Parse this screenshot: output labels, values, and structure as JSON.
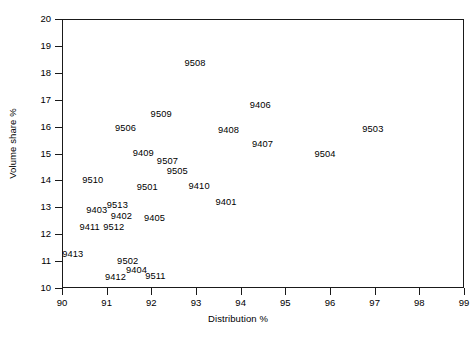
{
  "chart_data": {
    "type": "scatter",
    "title": "",
    "xlabel": "Distribution %",
    "ylabel": "Volume share %",
    "xlim": [
      90,
      99
    ],
    "ylim": [
      10,
      20
    ],
    "xticks": [
      90,
      91,
      92,
      93,
      94,
      95,
      96,
      97,
      98,
      99
    ],
    "yticks": [
      10,
      11,
      12,
      13,
      14,
      15,
      16,
      17,
      18,
      19,
      20
    ],
    "xtick_labels": [
      "90",
      "91",
      "92",
      "93",
      "94",
      "95",
      "96",
      "97",
      "98",
      "99"
    ],
    "ytick_labels": [
      "10",
      "11",
      "12",
      "13",
      "14",
      "15",
      "16",
      "17",
      "18",
      "19",
      "20"
    ],
    "grid": false,
    "legend": "none",
    "marker": "text-label",
    "points": [
      {
        "label": "9508",
        "x": 92.98,
        "y": 18.32
      },
      {
        "label": "9406",
        "x": 94.44,
        "y": 16.77
      },
      {
        "label": "9509",
        "x": 92.22,
        "y": 16.43
      },
      {
        "label": "9506",
        "x": 91.42,
        "y": 15.91
      },
      {
        "label": "9503",
        "x": 96.96,
        "y": 15.87
      },
      {
        "label": "9408",
        "x": 93.73,
        "y": 15.83
      },
      {
        "label": "9407",
        "x": 94.49,
        "y": 15.3
      },
      {
        "label": "9409",
        "x": 91.82,
        "y": 15.0
      },
      {
        "label": "9504",
        "x": 95.89,
        "y": 14.96
      },
      {
        "label": "9507",
        "x": 92.36,
        "y": 14.67
      },
      {
        "label": "9505",
        "x": 92.58,
        "y": 14.3
      },
      {
        "label": "9510",
        "x": 90.69,
        "y": 13.96
      },
      {
        "label": "9410",
        "x": 93.07,
        "y": 13.74
      },
      {
        "label": "9501",
        "x": 91.91,
        "y": 13.7
      },
      {
        "label": "9401",
        "x": 93.67,
        "y": 13.15
      },
      {
        "label": "9513",
        "x": 91.24,
        "y": 13.04
      },
      {
        "label": "9403",
        "x": 90.78,
        "y": 12.85
      },
      {
        "label": "9402",
        "x": 91.33,
        "y": 12.63
      },
      {
        "label": "9405",
        "x": 92.07,
        "y": 12.56
      },
      {
        "label": "9411",
        "x": 90.62,
        "y": 12.22
      },
      {
        "label": "9512",
        "x": 91.16,
        "y": 12.22
      },
      {
        "label": "9413",
        "x": 90.24,
        "y": 11.22
      },
      {
        "label": "9502",
        "x": 91.47,
        "y": 10.96
      },
      {
        "label": "9404",
        "x": 91.67,
        "y": 10.63
      },
      {
        "label": "9511",
        "x": 92.09,
        "y": 10.41
      },
      {
        "label": "9412",
        "x": 91.2,
        "y": 10.37
      }
    ]
  }
}
